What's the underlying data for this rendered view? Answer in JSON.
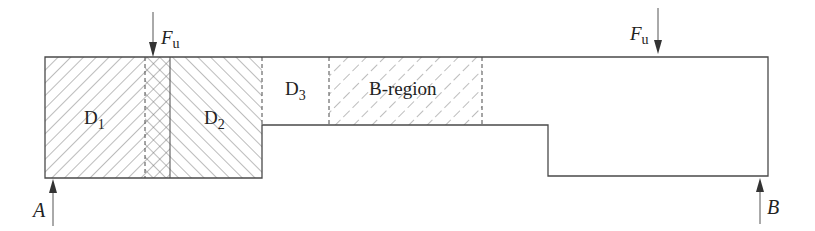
{
  "diagram": {
    "labels": {
      "d1": "D",
      "d1_sub": "1",
      "d2": "D",
      "d2_sub": "2",
      "d3": "D",
      "d3_sub": "3",
      "b_region": "B-region",
      "force_left": "F",
      "force_left_sub": "u",
      "force_right": "F",
      "force_right_sub": "u",
      "support_a": "A",
      "support_b": "B"
    },
    "colors": {
      "line": "#4a4a4a",
      "hatch": "#6a6a6a",
      "text": "#222222"
    }
  }
}
